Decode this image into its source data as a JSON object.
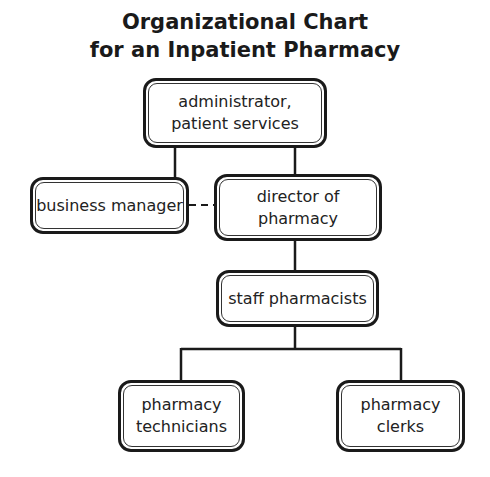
{
  "title": {
    "line1": "Organizational Chart",
    "line2": "for an Inpatient Pharmacy"
  },
  "nodes": {
    "administrator": "administrator,\npatient services",
    "business_manager": "business manager",
    "director": "director of\npharmacy",
    "staff_pharmacists": "staff pharmacists",
    "technicians": "pharmacy\ntechnicians",
    "clerks": "pharmacy\nclerks"
  },
  "edges": [
    {
      "from": "administrator",
      "to": "business_manager",
      "style": "solid"
    },
    {
      "from": "administrator",
      "to": "director",
      "style": "solid"
    },
    {
      "from": "business_manager",
      "to": "director",
      "style": "dashed"
    },
    {
      "from": "director",
      "to": "staff_pharmacists",
      "style": "solid"
    },
    {
      "from": "staff_pharmacists",
      "to": "technicians",
      "style": "solid"
    },
    {
      "from": "staff_pharmacists",
      "to": "clerks",
      "style": "solid"
    }
  ]
}
